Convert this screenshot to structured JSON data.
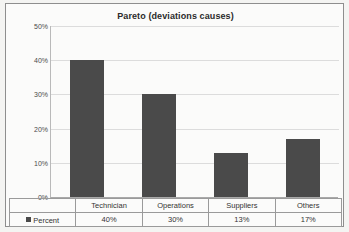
{
  "chart_data": {
    "type": "bar",
    "title": "Pareto (deviations causes)",
    "xlabel": "",
    "ylabel": "",
    "categories": [
      "Technician",
      "Operations",
      "Suppliers",
      "Others"
    ],
    "values": [
      40,
      30,
      13,
      17
    ],
    "value_labels": [
      "40%",
      "30%",
      "13%",
      "17%"
    ],
    "series": [
      {
        "name": "Percent",
        "values": [
          40,
          30,
          13,
          17
        ]
      }
    ],
    "ylim": [
      0,
      50
    ],
    "y_ticks": [
      0,
      10,
      20,
      30,
      40,
      50
    ],
    "y_tick_labels": [
      "0%",
      "10%",
      "20%",
      "30%",
      "40%",
      "50%"
    ],
    "grid": true,
    "legend": "Percent",
    "legend_position": "data-table-left",
    "bar_color": "#4a4a4a",
    "gridline_color": "#dcdcdc"
  },
  "table": {
    "legend_label": "Percent",
    "header_row": [
      "Technician",
      "Operations",
      "Suppliers",
      "Others"
    ],
    "value_row": [
      "40%",
      "30%",
      "13%",
      "17%"
    ]
  }
}
